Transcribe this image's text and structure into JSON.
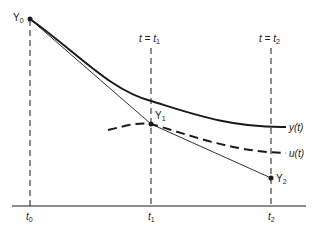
{
  "diagram": {
    "type": "numerical-integration-illustration",
    "colors": {
      "ink": "#1a1a1a",
      "background": "#ffffff"
    },
    "labels": {
      "y0": {
        "base": "Y",
        "sub": "0"
      },
      "y1": {
        "base": "Y",
        "sub": "1"
      },
      "y2": {
        "base": "Y",
        "sub": "2"
      },
      "t_eq_t1": {
        "base": "t = t",
        "sub": "1"
      },
      "t_eq_t2": {
        "base": "t = t",
        "sub": "2"
      },
      "curve_y": "y(t)",
      "curve_u": "u(t)",
      "tick_t0": {
        "base": "t",
        "sub": "0"
      },
      "tick_t1": {
        "base": "t",
        "sub": "1"
      },
      "tick_t2": {
        "base": "t",
        "sub": "2"
      }
    },
    "curves": [
      {
        "name": "y(t)",
        "style": "solid-thick",
        "description": "exact solution"
      },
      {
        "name": "u(t)",
        "style": "dashed-thick",
        "description": "local solution through Y1"
      },
      {
        "name": "euler-steps",
        "style": "solid-thin",
        "points": [
          "Y0",
          "Y1",
          "Y2"
        ]
      }
    ],
    "verticals": [
      "t0",
      "t1",
      "t2"
    ]
  }
}
